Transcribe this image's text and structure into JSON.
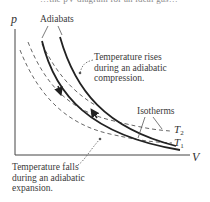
{
  "figure": {
    "cut_off_text": "…the pV-diagram for an ideal gas…",
    "axes": {
      "y_label": "p",
      "x_label": "V"
    },
    "labels": {
      "adiabats": "Adiabats",
      "isotherms": "Isotherms",
      "t2": "T",
      "t2_sub": "2",
      "t1": "T",
      "t1_sub": "1"
    },
    "annotations": {
      "compression": [
        "Temperature rises",
        "during an adiabatic",
        "compression."
      ],
      "expansion": [
        "Temperature falls",
        "during an adiabatic",
        "expansion."
      ]
    },
    "curves": [
      {
        "name": "adiabat-expansion",
        "style": "solid",
        "arrow": "down"
      },
      {
        "name": "adiabat-compression",
        "style": "solid",
        "arrow": "up"
      },
      {
        "name": "isotherm-T2",
        "style": "dashed"
      },
      {
        "name": "isotherm-T1",
        "style": "dashed"
      }
    ],
    "colors": {
      "line": "#222222",
      "text": "#3a3a3a",
      "dashed": "#555555"
    }
  }
}
